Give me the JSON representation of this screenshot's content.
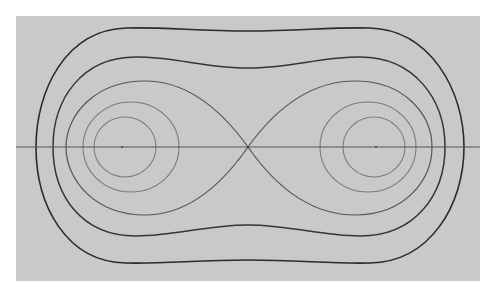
{
  "figure": {
    "colors": {
      "background": "#ffffff",
      "panel": "#c9c9c9",
      "outer_curves": "#2b2b2b",
      "separatrix": "#555555",
      "inner_orbits": "#7e7e7e"
    },
    "panel": {
      "x": 16,
      "y": 16,
      "width": 464,
      "height": 265
    },
    "axis_y": 147,
    "saddle_point": {
      "x": 248,
      "y": 147
    },
    "centers": [
      {
        "x": 123,
        "y": 147
      },
      {
        "x": 375,
        "y": 147
      }
    ],
    "curves": [
      {
        "name": "outer-orbit",
        "type": "peanut"
      },
      {
        "name": "middle-orbit",
        "type": "peanut"
      },
      {
        "name": "separatrix",
        "type": "figure-eight"
      },
      {
        "name": "left-ring",
        "type": "closed"
      },
      {
        "name": "left-inner",
        "type": "closed"
      },
      {
        "name": "right-ring",
        "type": "closed"
      },
      {
        "name": "right-inner",
        "type": "closed"
      }
    ]
  }
}
